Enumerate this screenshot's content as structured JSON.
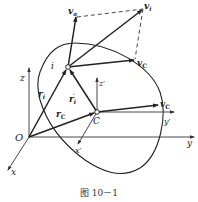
{
  "caption": "图 10－1",
  "labels": {
    "v_a": "v",
    "v_a_sub": "a",
    "v_i": "v",
    "v_i_sub": "i",
    "v_C_top": "v",
    "v_C_top_sub": "C",
    "v_C_right": "v",
    "v_C_right_sub": "C",
    "point_i": "i",
    "r_i": "r",
    "r_i_sub": "i",
    "r_i_prime": "r",
    "r_i_prime_sub": "i",
    "r_i_prime_mark": "′",
    "r_C": "r",
    "r_C_sub": "C",
    "origin": "O",
    "point_C": "C",
    "axis_x": "x",
    "axis_y": "y",
    "axis_z": "z",
    "axis_x_prime": "x′",
    "axis_y_prime": "y′",
    "axis_z_prime": "z′"
  },
  "colors": {
    "stroke": "#222222",
    "background": "#ffffff"
  }
}
